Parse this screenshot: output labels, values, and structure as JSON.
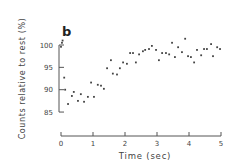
{
  "chart_data": {
    "type": "scatter",
    "title": "",
    "panel_label": "b",
    "xlabel": "Time (sec)",
    "ylabel": "Counts relative to rest (%)",
    "xlim": [
      0,
      5
    ],
    "ylim": [
      85,
      100
    ],
    "xticks": [
      0,
      1,
      2,
      3,
      4,
      5
    ],
    "yticks": [
      85,
      90,
      95,
      100
    ],
    "grid": false,
    "legend": null,
    "series": [
      {
        "name": "counts",
        "x": [
          0.0,
          0.03,
          0.05,
          0.1,
          0.13,
          0.22,
          0.34,
          0.4,
          0.53,
          0.62,
          0.72,
          0.84,
          0.94,
          1.03,
          1.15,
          1.25,
          1.34,
          1.44,
          1.56,
          1.62,
          1.75,
          1.84,
          1.94,
          2.06,
          2.16,
          2.25,
          2.34,
          2.44,
          2.56,
          2.63,
          2.75,
          2.84,
          2.97,
          3.06,
          3.16,
          3.28,
          3.38,
          3.47,
          3.56,
          3.66,
          3.78,
          3.88,
          3.97,
          4.06,
          4.16,
          4.25,
          4.38,
          4.47,
          4.56,
          4.69,
          4.75,
          4.88,
          4.97
        ],
        "y": [
          99.6,
          100.5,
          101.0,
          92.7,
          90.0,
          86.8,
          88.6,
          89.5,
          87.5,
          89.0,
          87.3,
          88.4,
          91.6,
          88.4,
          91.1,
          90.9,
          90.2,
          94.8,
          96.6,
          93.6,
          93.4,
          94.8,
          96.1,
          95.8,
          98.2,
          98.2,
          96.1,
          97.9,
          98.6,
          98.9,
          99.1,
          99.8,
          98.9,
          96.6,
          98.2,
          98.2,
          97.9,
          100.5,
          97.3,
          99.5,
          98.4,
          101.4,
          97.5,
          97.3,
          96.1,
          98.9,
          97.7,
          99.1,
          99.1,
          100.2,
          97.5,
          99.5,
          99.1
        ]
      }
    ]
  },
  "colors": {
    "axis": "#555555",
    "points": "#444444",
    "text": "#444444"
  }
}
